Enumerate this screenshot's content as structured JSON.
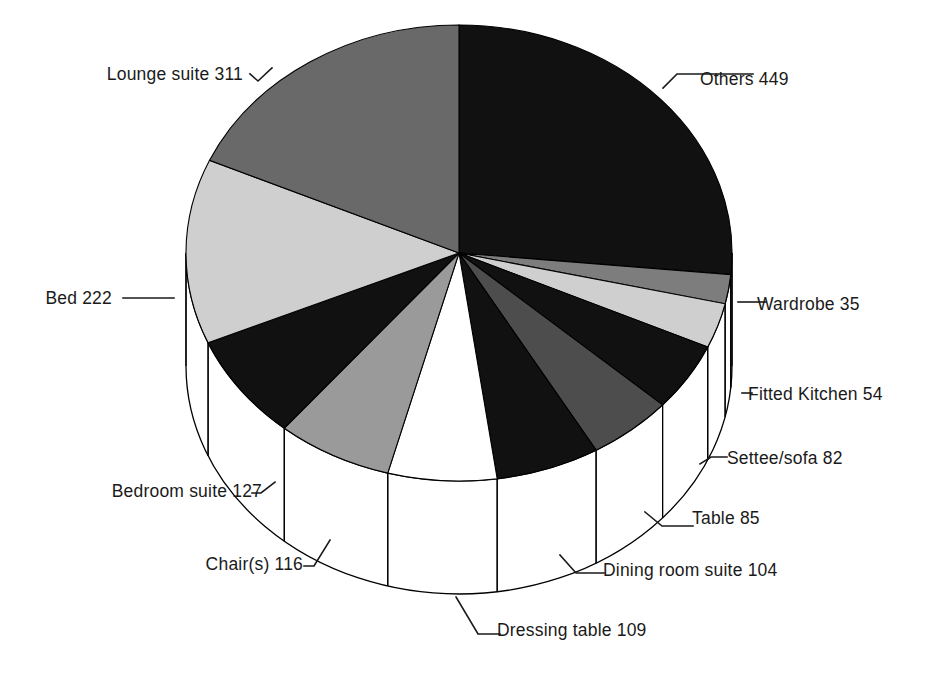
{
  "chart_data": {
    "type": "pie",
    "title": "",
    "subtitle": "",
    "xlabel": "",
    "ylabel": "",
    "legend_position": "none",
    "grid": false,
    "style": "3d-pie",
    "total": 1694,
    "categories": [
      "Others",
      "Wardrobe",
      "Fitted Kitchen",
      "Settee/sofa",
      "Table",
      "Dining room suite",
      "Dressing table",
      "Chair(s)",
      "Bedroom suite",
      "Bed",
      "Lounge suite"
    ],
    "values": [
      449,
      35,
      54,
      82,
      85,
      104,
      109,
      116,
      127,
      222,
      311
    ],
    "slices": [
      {
        "label": "Others 449",
        "name": "Others",
        "value": 449,
        "color": "#111111",
        "start_deg": 0.0,
        "end_deg": 95.44,
        "label_x": 700,
        "label_y": 85,
        "anchor": "start"
      },
      {
        "label": "Wardrobe 35",
        "name": "Wardrobe",
        "value": 35,
        "color": "#7d7d7d",
        "start_deg": 95.44,
        "end_deg": 102.88,
        "label_x": 757,
        "label_y": 310,
        "anchor": "start"
      },
      {
        "label": "Fitted Kitchen 54",
        "name": "Fitted Kitchen",
        "value": 54,
        "color": "#cfcfcf",
        "start_deg": 102.88,
        "end_deg": 114.35,
        "label_x": 748,
        "label_y": 400,
        "anchor": "start"
      },
      {
        "label": "Settee/sofa 82",
        "name": "Settee/sofa",
        "value": 82,
        "color": "#111111",
        "start_deg": 114.35,
        "end_deg": 131.78,
        "label_x": 727,
        "label_y": 464,
        "anchor": "start"
      },
      {
        "label": "Table 85",
        "name": "Table",
        "value": 85,
        "color": "#4d4d4d",
        "start_deg": 131.78,
        "end_deg": 149.85,
        "label_x": 692,
        "label_y": 524,
        "anchor": "start"
      },
      {
        "label": "Dining room suite 104",
        "name": "Dining room suite",
        "value": 104,
        "color": "#111111",
        "start_deg": 149.85,
        "end_deg": 171.96,
        "label_x": 603,
        "label_y": 576,
        "anchor": "start"
      },
      {
        "label": "Dressing table 109",
        "name": "Dressing table",
        "value": 109,
        "color": "#ffffff",
        "start_deg": 171.96,
        "end_deg": 195.13,
        "label_x": 497,
        "label_y": 636,
        "anchor": "start"
      },
      {
        "label": "Chair(s) 116",
        "name": "Chair(s)",
        "value": 116,
        "color": "#9a9a9a",
        "start_deg": 195.13,
        "end_deg": 219.79,
        "label_x": 303,
        "label_y": 570,
        "anchor": "end"
      },
      {
        "label": "Bedroom suite 127",
        "name": "Bedroom suite",
        "value": 127,
        "color": "#111111",
        "start_deg": 219.79,
        "end_deg": 246.79,
        "label_x": 262,
        "label_y": 497,
        "anchor": "end"
      },
      {
        "label": "Bed 222",
        "name": "Bed",
        "value": 222,
        "color": "#cfcfcf",
        "start_deg": 246.79,
        "end_deg": 293.98,
        "label_x": 112,
        "label_y": 304,
        "anchor": "end"
      },
      {
        "label": "Lounge suite 311",
        "name": "Lounge suite",
        "value": 311,
        "color": "#696969",
        "start_deg": 293.98,
        "end_deg": 360.0,
        "label_x": 243,
        "label_y": 80,
        "anchor": "end"
      }
    ],
    "leaders": [
      {
        "name": "leader-others",
        "d": "M 663 88 L 677 74 L 753 74"
      },
      {
        "name": "leader-wardrobe",
        "d": "M 738 302 L 766 302"
      },
      {
        "name": "leader-fitted-kitchen",
        "d": "M 742 393 L 752 393"
      },
      {
        "name": "leader-settee-sofa",
        "d": "M 700 464 L 711 457 L 727 457"
      },
      {
        "name": "leader-table",
        "d": "M 645 512 L 662 526 L 693 526"
      },
      {
        "name": "leader-dining-room-suite",
        "d": "M 560 555 L 576 573 L 604 573"
      },
      {
        "name": "leader-dressing-table",
        "d": "M 456 597 L 478 634 L 500 634"
      },
      {
        "name": "leader-chair",
        "d": "M 330 540 L 314 566 L 304 566"
      },
      {
        "name": "leader-bedroom-suite",
        "d": "M 275 482 L 261 493 L 252 493"
      },
      {
        "name": "leader-bed",
        "d": "M 174 298 L 123 298"
      },
      {
        "name": "leader-lounge-suite",
        "d": "M 272 68 L 258 81 L 250 74"
      }
    ],
    "geometry": {
      "cx": 459,
      "cy": 253,
      "rx": 273,
      "ry": 228,
      "depth": 113
    }
  }
}
